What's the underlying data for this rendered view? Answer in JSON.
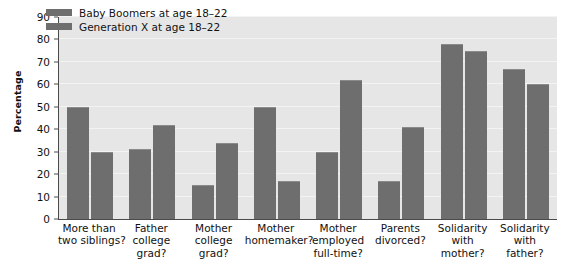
{
  "chart_data": {
    "type": "bar",
    "title": "",
    "xlabel": "",
    "ylabel": "Percentage",
    "ylim": [
      0,
      90
    ],
    "ytick_step": 10,
    "yticks": [
      0,
      10,
      20,
      30,
      40,
      50,
      60,
      70,
      80,
      90
    ],
    "grid": true,
    "legend_position": "top-left-inside",
    "categories": [
      "More than two siblings?",
      "Father college grad?",
      "Mother college grad?",
      "Mother homemaker?",
      "Mother employed full-time?",
      "Parents divorced?",
      "Solidarity with mother?",
      "Solidarity with father?"
    ],
    "category_lines": [
      [
        "More than",
        "two siblings?"
      ],
      [
        "Father",
        "college",
        "grad?"
      ],
      [
        "Mother",
        "college",
        "grad?"
      ],
      [
        "Mother",
        "homemaker?"
      ],
      [
        "Mother",
        "employed",
        "full-time?"
      ],
      [
        "Parents",
        "divorced?"
      ],
      [
        "Solidarity",
        "with",
        "mother?"
      ],
      [
        "Solidarity",
        "with",
        "father?"
      ]
    ],
    "series": [
      {
        "name": "Baby Boomers at age 18–22",
        "color": "#6e6e6e",
        "values": [
          50,
          31,
          15,
          50,
          30,
          17,
          78,
          67
        ]
      },
      {
        "name": "Generation X at age 18–22",
        "color": "#6e6e6e",
        "values": [
          30,
          42,
          34,
          17,
          62,
          41,
          75,
          60
        ]
      }
    ]
  },
  "legend": {
    "items": [
      {
        "label": "Baby Boomers at age 18–22"
      },
      {
        "label": "Generation X at age 18–22"
      }
    ]
  },
  "axes": {
    "y_title": "Percentage"
  },
  "colors": {
    "bar": "#6e6e6e",
    "plot_background": "#e6e6e6",
    "gridline": "#f3f3f3",
    "axis": "#4a4a4a",
    "text": "#111111",
    "page_background": "#ffffff"
  }
}
